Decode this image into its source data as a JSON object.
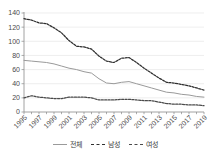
{
  "chart_data": {
    "type": "line",
    "title": "",
    "xlabel": "",
    "ylabel": "",
    "ylim": [
      0,
      140
    ],
    "ytick_values": [
      0,
      20,
      40,
      60,
      80,
      100,
      120,
      140
    ],
    "grid": true,
    "legend_position": "bottom",
    "x": [
      1995,
      1996,
      1997,
      1998,
      1999,
      2000,
      2001,
      2002,
      2003,
      2004,
      2005,
      2006,
      2007,
      2008,
      2009,
      2010,
      2011,
      2012,
      2013,
      2014,
      2015,
      2016,
      2017,
      2018,
      2019
    ],
    "xtick_labels": [
      "1995",
      "1997",
      "1999",
      "2001",
      "2003",
      "2005",
      "2007",
      "2009",
      "2011",
      "2013",
      "2015",
      "2017",
      "2019"
    ],
    "xtick_years": [
      1995,
      1997,
      1999,
      2001,
      2003,
      2005,
      2007,
      2009,
      2011,
      2013,
      2015,
      2017,
      2019
    ],
    "series": [
      {
        "name": "전체",
        "style": "solid",
        "color": "#9a9a9a",
        "values": [
          73,
          72,
          71,
          70,
          68,
          65,
          62,
          60,
          57,
          55,
          47,
          41,
          40,
          42,
          43,
          40,
          37,
          34,
          31,
          28,
          27,
          25,
          24,
          22,
          21
        ]
      },
      {
        "name": "남성",
        "style": "dashed",
        "color": "#2f2f2f",
        "values": [
          132,
          130,
          126,
          125,
          119,
          112,
          101,
          93,
          92,
          89,
          79,
          72,
          70,
          76,
          77,
          70,
          62,
          55,
          48,
          42,
          41,
          39,
          37,
          34,
          31
        ]
      },
      {
        "name": "여성",
        "style": "dashed",
        "color": "#4a4a4a",
        "values": [
          20,
          23,
          21,
          20,
          19,
          19,
          21,
          21,
          21,
          20,
          17,
          17,
          17,
          18,
          18,
          17,
          16,
          16,
          14,
          12,
          11,
          11,
          10,
          10,
          9
        ]
      }
    ]
  },
  "legend": {
    "items": [
      {
        "label": "전체"
      },
      {
        "label": "남성"
      },
      {
        "label": "여성"
      }
    ]
  }
}
